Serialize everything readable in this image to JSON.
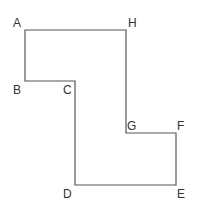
{
  "diagram": {
    "type": "polygon",
    "stroke_color": "#555555",
    "vertices": [
      {
        "label": "A",
        "x": 25,
        "y": 30,
        "lx": 13,
        "ly": 27
      },
      {
        "label": "H",
        "x": 126,
        "y": 30,
        "lx": 128,
        "ly": 27
      },
      {
        "label": "G",
        "x": 126,
        "y": 133,
        "lx": 127,
        "ly": 130
      },
      {
        "label": "F",
        "x": 176,
        "y": 133,
        "lx": 177,
        "ly": 130
      },
      {
        "label": "E",
        "x": 176,
        "y": 185,
        "lx": 177,
        "ly": 198
      },
      {
        "label": "D",
        "x": 75,
        "y": 185,
        "lx": 63,
        "ly": 198
      },
      {
        "label": "C",
        "x": 75,
        "y": 81,
        "lx": 63,
        "ly": 94
      },
      {
        "label": "B",
        "x": 25,
        "y": 81,
        "lx": 13,
        "ly": 94
      }
    ]
  }
}
